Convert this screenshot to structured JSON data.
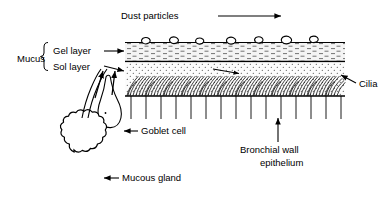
{
  "diagram": {
    "title_visible": false,
    "labels": {
      "dust_particles": "Dust particles",
      "mucus": "Mucus",
      "gel_layer": "Gel layer",
      "sol_layer": "Sol layer",
      "cilia": "Cilia",
      "goblet_cell": "Goblet cell",
      "mucous_gland": "Mucous gland",
      "bronchial_wall_line1": "Bronchial wall",
      "bronchial_wall_line2": "epithelium"
    },
    "icons": {
      "dust_flow_arrow": "arrow-right-icon",
      "gel_layer_arrow": "arrow-right-icon",
      "sol_layer_arrow": "arrow-right-icon",
      "cilia_arrow": "arrow-up-left-icon",
      "goblet_cell_arrow": "arrow-left-icon",
      "mucous_gland_arrow": "arrow-left-icon",
      "epithelium_arrow": "arrow-up-icon",
      "cilia_beat_arrow": "arrow-right-icon",
      "secretion_arrow_duct": "arrow-up-icon",
      "secretion_arrow_goblet": "arrow-up-icon",
      "mucus_brace": "curly-brace-icon"
    },
    "colors": {
      "ink": "#000000",
      "background": "#ffffff",
      "gel_fill": "#f2f2f2",
      "sol_fill": "#fafafa"
    },
    "structure": {
      "dust_particle_count": 7,
      "epithelial_cell_divider_count": 14,
      "layer_left_x": 125,
      "layer_right_x": 345,
      "mucus_surface_y": 42,
      "gel_sol_boundary_y": 62,
      "epithelium_top_y": 96
    }
  }
}
